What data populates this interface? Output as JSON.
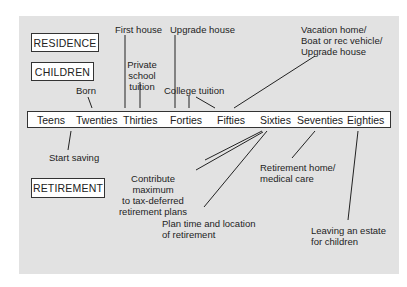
{
  "categories": {
    "residence": "RESIDENCE",
    "children": "CHILDREN",
    "retirement": "RETIREMENT"
  },
  "timeline": [
    "Teens",
    "Twenties",
    "Thirties",
    "Forties",
    "Fifties",
    "Sixties",
    "Seventies",
    "Eighties"
  ],
  "above": {
    "first_house": "First house",
    "upgrade_house": "Upgrade house",
    "private_school_1": "Private school",
    "private_school_2": "tuition",
    "born": "Born",
    "college_tuition": "College tuition",
    "vacation_1": "Vacation home/",
    "vacation_2": "Boat or rec vehicle/",
    "vacation_3": "Upgrade house"
  },
  "below": {
    "start_saving": "Start saving",
    "contribute_1": "Contribute maximum",
    "contribute_2": "to tax-deferred",
    "contribute_3": "retirement plans",
    "plan_1": "Plan time and location",
    "plan_2": "of retirement",
    "ret_home_1": "Retirement home/",
    "ret_home_2": "medical care",
    "estate_1": "Leaving an estate",
    "estate_2": "for children"
  }
}
